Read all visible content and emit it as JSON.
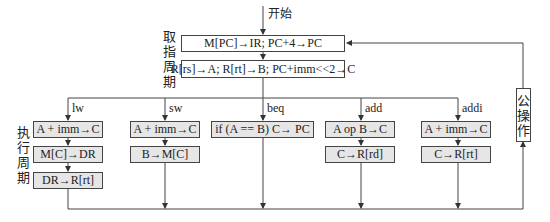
{
  "start_label": "开始",
  "fetch_label": [
    "取",
    "指",
    "周",
    "期"
  ],
  "exec_label": [
    "执",
    "行",
    "周",
    "期"
  ],
  "common_label": [
    "公",
    "操",
    "作"
  ],
  "fetch_boxes": [
    "M[PC]→IR;  PC+4→PC",
    "R[rs]→A; R[rt]→B; PC+imm<<2→C"
  ],
  "branches": [
    {
      "op": "lw",
      "steps": [
        "A + imm→C",
        "M[C]→DR",
        "DR→R[rt]"
      ]
    },
    {
      "op": "sw",
      "steps": [
        "A + imm→C",
        "B→M[C]"
      ]
    },
    {
      "op": "beq",
      "steps": [
        "if (A == B)  C→ PC"
      ]
    },
    {
      "op": "add",
      "steps": [
        "A op B→C",
        "C→R[rd]"
      ]
    },
    {
      "op": "addi",
      "steps": [
        "A + imm→C",
        "C→R[rt]"
      ]
    }
  ]
}
